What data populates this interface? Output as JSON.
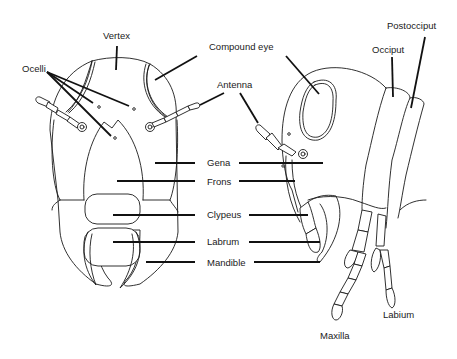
{
  "diagram": {
    "views": [
      {
        "name": "front view",
        "labels": [
          "Vertex",
          "Ocelli",
          "Compound eye",
          "Antenna",
          "Gena",
          "Frons",
          "Clypeus",
          "Labrum",
          "Mandible"
        ]
      },
      {
        "name": "side view",
        "labels": [
          "Compound eye",
          "Antenna",
          "Occiput",
          "Postocciput",
          "Gena",
          "Frons",
          "Clypeus",
          "Labrum",
          "Mandible",
          "Maxilla",
          "Labium"
        ]
      }
    ],
    "labels": {
      "vertex": "Vertex",
      "ocelli": "Ocelli",
      "compound_eye": "Compound eye",
      "antenna": "Antenna",
      "occiput": "Occiput",
      "postocciput": "Postocciput",
      "gena": "Gena",
      "frons": "Frons",
      "clypeus": "Clypeus",
      "labrum": "Labrum",
      "mandible": "Mandible",
      "maxilla": "Maxilla",
      "labium": "Labium"
    },
    "colors": {
      "line": "#1a1a1a",
      "background": "#ffffff"
    }
  }
}
